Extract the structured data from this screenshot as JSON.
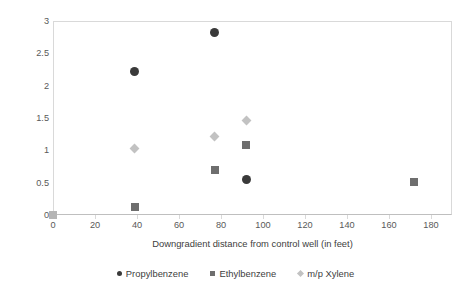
{
  "chart_data": {
    "type": "scatter",
    "title": "",
    "xlabel": "Downgradient distance from control well (in feet)",
    "ylabel_text": "δ13C difference from control well as ε",
    "ylabel_prefix": "δ",
    "ylabel_sup": "13",
    "ylabel_suffix": "C difference from control well as ε",
    "xlim": [
      0,
      190
    ],
    "ylim": [
      0,
      3
    ],
    "xticks": [
      0,
      20,
      40,
      60,
      80,
      100,
      120,
      140,
      160,
      180
    ],
    "xtick_labels": [
      "0",
      "20",
      "40",
      "60",
      "80",
      "100",
      "120",
      "140",
      "160",
      "180"
    ],
    "yticks": [
      0,
      0.5,
      1,
      1.5,
      2,
      2.5,
      3
    ],
    "ytick_labels": [
      "0",
      "0.5",
      "1",
      "1.5",
      "2",
      "2.5",
      "3"
    ],
    "grid": false,
    "legend_position": "bottom",
    "series": [
      {
        "name": "Propylbenzene",
        "marker": "circle",
        "color": "#3a3a3a",
        "points": [
          {
            "x": 39,
            "y": 2.22
          },
          {
            "x": 77,
            "y": 2.82
          },
          {
            "x": 92,
            "y": 0.55
          }
        ]
      },
      {
        "name": "Ethylbenzene",
        "marker": "square",
        "color": "#6e6e6e",
        "points": [
          {
            "x": 0,
            "y": 0.0
          },
          {
            "x": 39,
            "y": 0.12
          },
          {
            "x": 77,
            "y": 0.7
          },
          {
            "x": 92,
            "y": 1.09
          },
          {
            "x": 172,
            "y": 0.51
          }
        ]
      },
      {
        "name": "m/p Xylene",
        "marker": "diamond",
        "color": "#c2c2c2",
        "points": [
          {
            "x": 39,
            "y": 1.03
          },
          {
            "x": 77,
            "y": 1.21
          },
          {
            "x": 92,
            "y": 1.46
          }
        ]
      }
    ]
  },
  "legend": {
    "items": [
      {
        "label": "Propylbenzene",
        "marker": "circle"
      },
      {
        "label": "Ethylbenzene",
        "marker": "square"
      },
      {
        "label": "m/p Xylene",
        "marker": "diamond"
      }
    ]
  }
}
